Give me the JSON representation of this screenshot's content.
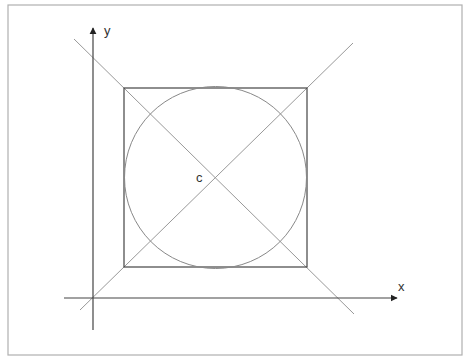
{
  "diagram": {
    "frame": {
      "x": 8,
      "y": 5,
      "width": 454,
      "height": 350,
      "stroke": "#b0b0b0"
    },
    "axes": {
      "y_axis": {
        "x": 93,
        "y_top": 28,
        "y_bottom": 330,
        "label": "y"
      },
      "x_axis": {
        "y": 298,
        "x_left": 64,
        "x_right": 397,
        "label": "x"
      },
      "color": "#444444"
    },
    "square": {
      "x": 124,
      "y": 88,
      "width": 183,
      "height": 179,
      "stroke": "#444444"
    },
    "circle": {
      "cx": 215.5,
      "cy": 177.5,
      "r": 91,
      "stroke": "#888888"
    },
    "diagonals": [
      {
        "x1": 74,
        "y1": 39,
        "x2": 354,
        "y2": 314
      },
      {
        "x1": 80,
        "y1": 310,
        "x2": 353,
        "y2": 43
      }
    ],
    "diagonal_color": "#999999",
    "center_label": "c"
  }
}
